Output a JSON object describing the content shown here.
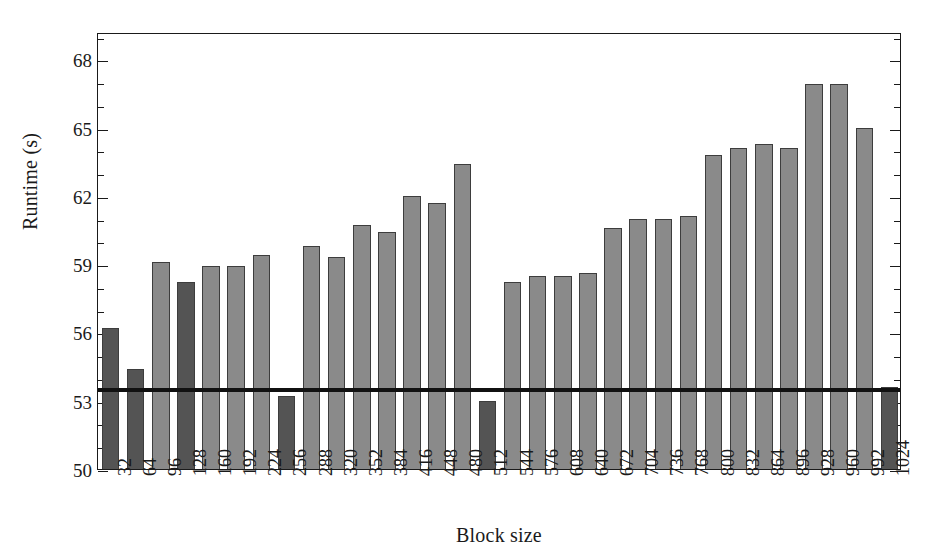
{
  "chart_data": {
    "type": "bar",
    "title": "",
    "xlabel": "Block size",
    "ylabel": "Runtime (s)",
    "ylim": [
      50,
      69.2
    ],
    "ytick_labels": [
      "50",
      "53",
      "56",
      "59",
      "62",
      "65",
      "68"
    ],
    "ytick_values": [
      50,
      53,
      56,
      59,
      62,
      65,
      68
    ],
    "yminor_step": 1,
    "grid": false,
    "legend": "none",
    "categories": [
      "32",
      "64",
      "96",
      "128",
      "160",
      "192",
      "224",
      "256",
      "288",
      "320",
      "352",
      "384",
      "416",
      "448",
      "480",
      "512",
      "544",
      "576",
      "608",
      "640",
      "672",
      "704",
      "736",
      "768",
      "800",
      "832",
      "864",
      "896",
      "928",
      "960",
      "992",
      "1024"
    ],
    "values": [
      56.2,
      54.4,
      59.1,
      58.2,
      58.9,
      58.9,
      59.4,
      53.2,
      59.8,
      59.3,
      60.7,
      60.4,
      62.0,
      61.7,
      63.4,
      53.0,
      58.2,
      58.5,
      58.5,
      58.6,
      60.6,
      61.0,
      61.0,
      61.1,
      63.8,
      64.1,
      64.3,
      64.1,
      66.9,
      66.9,
      65.0,
      53.6
    ],
    "bar_colors": [
      "#545454",
      "#545454",
      "#8a8a8a",
      "#545454",
      "#8a8a8a",
      "#8a8a8a",
      "#8a8a8a",
      "#545454",
      "#8a8a8a",
      "#8a8a8a",
      "#8a8a8a",
      "#8a8a8a",
      "#8a8a8a",
      "#8a8a8a",
      "#8a8a8a",
      "#545454",
      "#8a8a8a",
      "#8a8a8a",
      "#8a8a8a",
      "#8a8a8a",
      "#8a8a8a",
      "#8a8a8a",
      "#8a8a8a",
      "#8a8a8a",
      "#8a8a8a",
      "#8a8a8a",
      "#8a8a8a",
      "#8a8a8a",
      "#8a8a8a",
      "#8a8a8a",
      "#8a8a8a",
      "#545454"
    ],
    "reference_line": {
      "value": 53.65,
      "color": "#111111"
    },
    "colors": {
      "bar_dark": "#545454",
      "bar_light": "#8a8a8a",
      "axis": "#1a1a1a",
      "background": "#ffffff"
    }
  }
}
